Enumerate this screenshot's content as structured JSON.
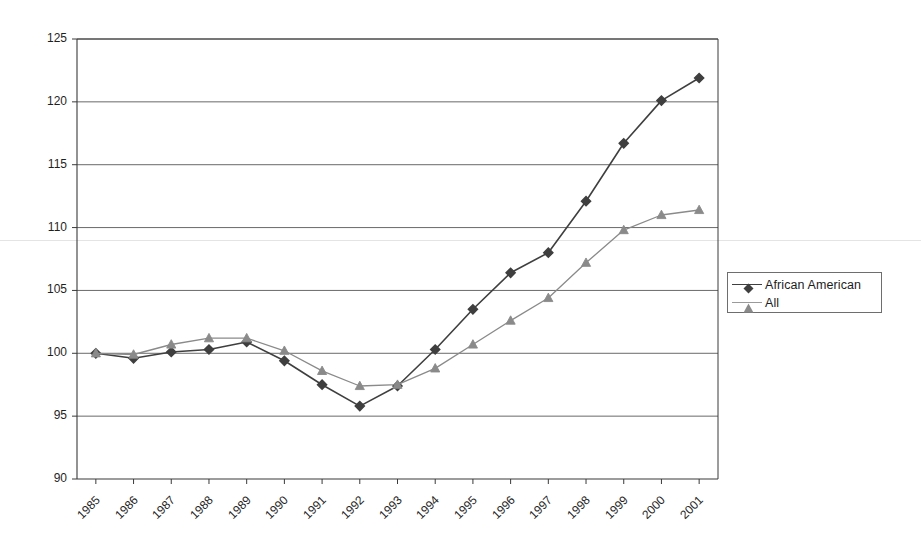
{
  "chart_data": {
    "type": "line",
    "title": "",
    "subtitle": "",
    "xlabel": "",
    "ylabel": "",
    "categories": [
      "1985",
      "1986",
      "1987",
      "1988",
      "1989",
      "1990",
      "1991",
      "1992",
      "1993",
      "1994",
      "1995",
      "1996",
      "1997",
      "1998",
      "1999",
      "2000",
      "2001"
    ],
    "x": [
      1985,
      1986,
      1987,
      1988,
      1989,
      1990,
      1991,
      1992,
      1993,
      1994,
      1995,
      1996,
      1997,
      1998,
      1999,
      2000,
      2001
    ],
    "ylim": [
      90,
      125
    ],
    "yticks": [
      90,
      95,
      100,
      105,
      110,
      115,
      120,
      125
    ],
    "ytick_labels": [
      "90",
      "95",
      "100",
      "105",
      "110",
      "115",
      "120",
      "125"
    ],
    "grid": "horizontal",
    "legend_position": "right",
    "series": [
      {
        "name": "African American",
        "color": "#3f3f3f",
        "marker": "diamond",
        "values": [
          100.0,
          99.6,
          100.1,
          100.3,
          100.9,
          99.4,
          97.5,
          95.8,
          97.4,
          100.3,
          103.5,
          106.4,
          108.0,
          112.1,
          116.7,
          120.1,
          121.9
        ]
      },
      {
        "name": "All",
        "color": "#8a8a8a",
        "marker": "triangle",
        "values": [
          100.0,
          99.9,
          100.7,
          101.2,
          101.2,
          100.2,
          98.6,
          97.4,
          97.5,
          98.8,
          100.7,
          102.6,
          104.4,
          107.2,
          109.8,
          111.0,
          111.4
        ]
      }
    ]
  },
  "legend": {
    "items": [
      {
        "label": "African American",
        "marker": "diamond-marker",
        "color": "#3f3f3f"
      },
      {
        "label": "All",
        "marker": "triangle-marker",
        "color": "#8a8a8a"
      }
    ]
  },
  "axes": {
    "y_axis_name": "value-axis",
    "x_axis_name": "year-axis"
  }
}
